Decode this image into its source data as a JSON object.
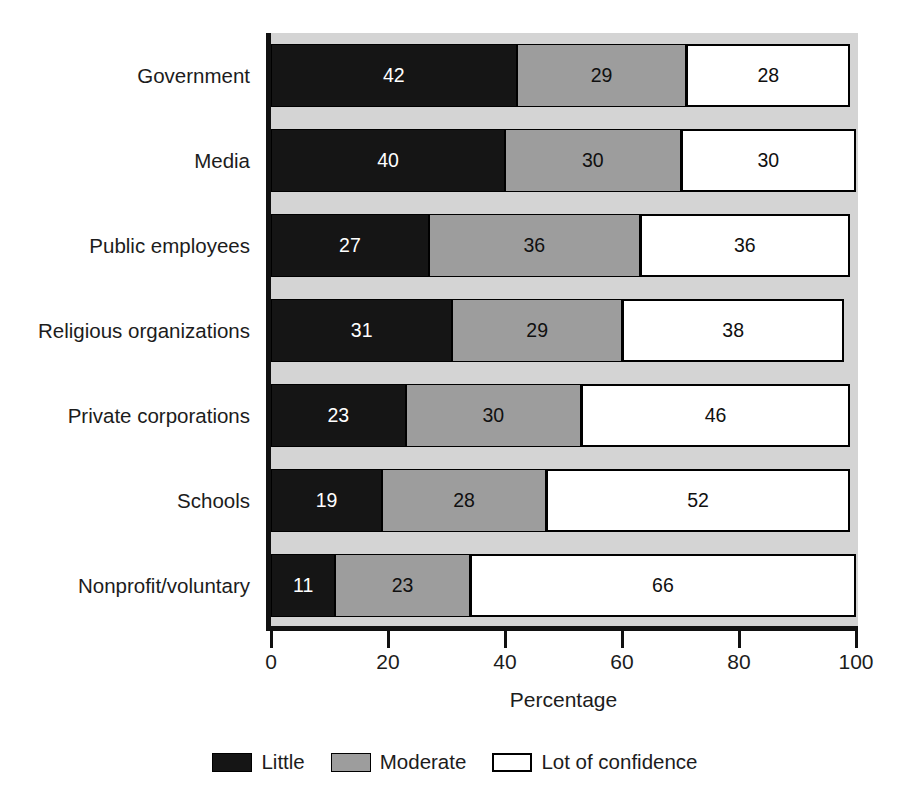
{
  "chart_data": {
    "type": "bar",
    "orientation": "horizontal",
    "stacked": true,
    "normalized": "100%",
    "title": "",
    "xlabel": "Percentage",
    "ylabel": "",
    "xlim": [
      0,
      100
    ],
    "xticks": [
      0,
      20,
      40,
      60,
      80,
      100
    ],
    "xtick_labels": [
      "0",
      "20",
      "40",
      "60",
      "80",
      "100"
    ],
    "grid": false,
    "legend_position": "bottom",
    "categories": [
      "Government",
      "Media",
      "Public employees",
      "Religious organizations",
      "Private corporations",
      "Schools",
      "Nonprofit/voluntary"
    ],
    "series": [
      {
        "name": "Little",
        "color": "#151515",
        "values": [
          42,
          40,
          27,
          31,
          23,
          19,
          11
        ]
      },
      {
        "name": "Moderate",
        "color": "#9d9d9d",
        "values": [
          29,
          30,
          36,
          29,
          30,
          28,
          23
        ]
      },
      {
        "name": "Lot of confidence",
        "color": "#ffffff",
        "values": [
          28,
          30,
          36,
          38,
          46,
          52,
          66
        ]
      }
    ],
    "rows": [
      {
        "category": "Government",
        "little": 42,
        "moderate": 29,
        "lot": 28
      },
      {
        "category": "Media",
        "little": 40,
        "moderate": 30,
        "lot": 30
      },
      {
        "category": "Public employees",
        "little": 27,
        "moderate": 36,
        "lot": 36
      },
      {
        "category": "Religious organizations",
        "little": 31,
        "moderate": 29,
        "lot": 38
      },
      {
        "category": "Private corporations",
        "little": 23,
        "moderate": 30,
        "lot": 46
      },
      {
        "category": "Schools",
        "little": 19,
        "moderate": 28,
        "lot": 52
      },
      {
        "category": "Nonprofit/voluntary",
        "little": 11,
        "moderate": 23,
        "lot": 66
      }
    ]
  },
  "axis": {
    "x_title": "Percentage",
    "ticks": [
      {
        "value": 0,
        "label": "0"
      },
      {
        "value": 20,
        "label": "20"
      },
      {
        "value": 40,
        "label": "40"
      },
      {
        "value": 60,
        "label": "60"
      },
      {
        "value": 80,
        "label": "80"
      },
      {
        "value": 100,
        "label": "100"
      }
    ]
  },
  "legend": {
    "items": [
      {
        "label": "Little",
        "color": "#151515"
      },
      {
        "label": "Moderate",
        "color": "#9d9d9d"
      },
      {
        "label": "Lot of confidence",
        "color": "#ffffff"
      }
    ]
  },
  "colors": {
    "plot_background": "#d4d4d4",
    "page_background": "#ffffff",
    "axis": "#111111",
    "text": "#1c1c1c",
    "little": "#151515",
    "moderate": "#9d9d9d",
    "lot": "#ffffff"
  }
}
